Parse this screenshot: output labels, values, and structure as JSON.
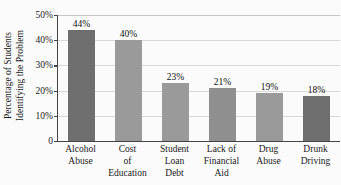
{
  "chart_data": {
    "type": "bar",
    "title": "",
    "xlabel": "",
    "ylabel": "Percentage of Students Identifying the Problem",
    "ylabel_lines": [
      "Percentage of Students",
      "Identifying the Problem"
    ],
    "categories": [
      "Alcohol Abuse",
      "Cost of Education",
      "Student Loan Debt",
      "Lack of Financial Aid",
      "Drug Abuse",
      "Drunk Driving"
    ],
    "category_lines": [
      [
        "Alcohol",
        "Abuse"
      ],
      [
        "Cost",
        "of",
        "Education"
      ],
      [
        "Student",
        "Loan",
        "Debt"
      ],
      [
        "Lack of",
        "Financial",
        "Aid"
      ],
      [
        "Drug",
        "Abuse"
      ],
      [
        "Drunk",
        "Driving"
      ]
    ],
    "values": [
      44,
      40,
      23,
      21,
      19,
      18
    ],
    "value_labels": [
      "44%",
      "40%",
      "23%",
      "21%",
      "19%",
      "18%"
    ],
    "bar_colors": [
      "#6e6e6e",
      "#9a9a9a",
      "#9a9a9a",
      "#8f8f8f",
      "#9a9a9a",
      "#6e6e6e"
    ],
    "ylim": [
      0,
      50
    ],
    "yticks": [
      0,
      10,
      20,
      30,
      40,
      50
    ],
    "ytick_labels": [
      "0",
      "10%",
      "20%",
      "30%",
      "40%",
      "50%"
    ],
    "grid": true,
    "legend": "none",
    "background": "#fbfbfb",
    "axis_color": "#444444",
    "gridline_color": "#d8d8d8"
  }
}
